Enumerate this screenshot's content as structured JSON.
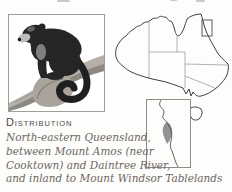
{
  "page": {
    "background_color": "#fdfdfc",
    "type": "field-guide-page-excerpt"
  },
  "photo": {
    "subject": "tree-kangaroo-on-branch-illustration",
    "frame_border_color": "#9d9d9a"
  },
  "map": {
    "country": "australia-outline-map",
    "outline_color": "#3f3f3d",
    "state_border_color": "#8f8f8c",
    "highlight_box_region": "north-eastern-queensland",
    "inset": {
      "region": "cape-york-coast-inset",
      "border_color": "#8d8d8a",
      "range_fill_color": "#8f9396"
    }
  },
  "distribution": {
    "heading": "Distribution",
    "lines": [
      "North-eastern Queensland,",
      "between Mount Amos (near",
      "Cooktown) and Daintree River,",
      "and inland to Mount Windsor Tablelands"
    ]
  }
}
